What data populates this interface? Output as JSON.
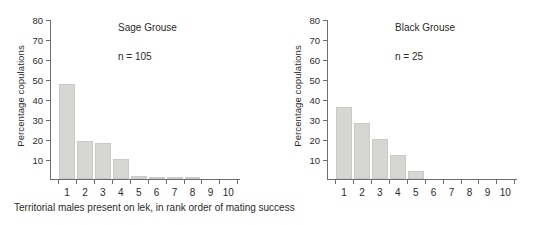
{
  "figure": {
    "caption": "Territorial males present on lek, in rank order of mating success",
    "bar_color": "#d6d6d2",
    "axis_color": "#6e6e6e"
  },
  "chart_data": [
    {
      "type": "bar",
      "title": "Sage Grouse",
      "annotation": "n = 105",
      "n": 105,
      "xlabel": "Territorial males present on lek, in rank order of mating success",
      "ylabel": "Percentage copulations",
      "categories": [
        "1",
        "2",
        "3",
        "4",
        "5",
        "6",
        "7",
        "8",
        "9",
        "10"
      ],
      "values": [
        47.5,
        19,
        18,
        10,
        1.5,
        1,
        1,
        1,
        0,
        0
      ],
      "ylim": [
        0,
        80
      ],
      "yticks": [
        10,
        20,
        30,
        40,
        50,
        60,
        70,
        80
      ],
      "grid": false,
      "legend": "none"
    },
    {
      "type": "bar",
      "title": "Black Grouse",
      "annotation": "n = 25",
      "n": 25,
      "xlabel": "Territorial males present on lek, in rank order of mating success",
      "ylabel": "Percentage copulations",
      "categories": [
        "1",
        "2",
        "3",
        "4",
        "5",
        "6",
        "7",
        "8",
        "9",
        "10"
      ],
      "values": [
        36,
        28,
        20,
        12,
        4,
        0,
        0,
        0,
        0,
        0
      ],
      "ylim": [
        0,
        80
      ],
      "yticks": [
        10,
        20,
        30,
        40,
        50,
        60,
        70,
        80
      ],
      "grid": false,
      "legend": "none"
    }
  ]
}
